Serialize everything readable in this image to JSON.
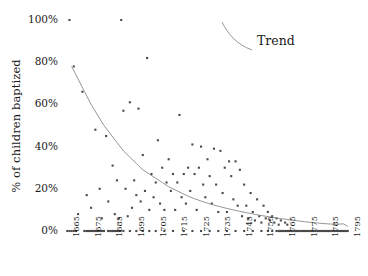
{
  "chart_data": {
    "type": "scatter",
    "title": "",
    "subtitle": "",
    "xlabel": "",
    "ylabel": "% of children baptized",
    "xlim": [
      1663,
      1797
    ],
    "ylim": [
      0,
      100
    ],
    "grid": false,
    "legend_position": "top-right",
    "legend": [
      {
        "name": "Trend",
        "style": "curve",
        "color": "#8a8a8a"
      }
    ],
    "annotations": [
      {
        "text": "Trend",
        "x": 1757,
        "y": 92
      }
    ],
    "y_ticks": [
      0,
      20,
      40,
      60,
      80,
      100
    ],
    "y_tick_labels": [
      "0%",
      "20%",
      "40%",
      "60%",
      "80%",
      "100%"
    ],
    "x_ticks": [
      1665,
      1675,
      1685,
      1695,
      1705,
      1715,
      1725,
      1735,
      1745,
      1755,
      1765,
      1775,
      1785,
      1795
    ],
    "x_tick_labels": [
      "1665",
      "1675",
      "1685",
      "1695",
      "1705",
      "1715",
      "1725",
      "1735",
      "1745",
      "1755",
      "1765",
      "1775",
      "1785",
      "1795"
    ],
    "marker": {
      "shape": "square",
      "size": 2.1,
      "color": "#4a4a4a"
    },
    "series": [
      {
        "name": "Parishes",
        "marker_color": "#4a4a4a",
        "points": [
          [
            1666,
            100
          ],
          [
            1690,
            100
          ],
          [
            1702,
            82
          ],
          [
            1668,
            78
          ],
          [
            1672,
            66
          ],
          [
            1694,
            61
          ],
          [
            1698,
            58
          ],
          [
            1691,
            57
          ],
          [
            1717,
            55
          ],
          [
            1678,
            48
          ],
          [
            1683,
            45
          ],
          [
            1707,
            43
          ],
          [
            1723,
            41
          ],
          [
            1727,
            40
          ],
          [
            1733,
            39
          ],
          [
            1736,
            38
          ],
          [
            1700,
            36
          ],
          [
            1712,
            34
          ],
          [
            1730,
            34
          ],
          [
            1740,
            33
          ],
          [
            1743,
            33
          ],
          [
            1686,
            31
          ],
          [
            1709,
            30
          ],
          [
            1721,
            30
          ],
          [
            1726,
            30
          ],
          [
            1738,
            30
          ],
          [
            1745,
            29
          ],
          [
            1704,
            27
          ],
          [
            1714,
            27
          ],
          [
            1719,
            27
          ],
          [
            1724,
            27
          ],
          [
            1731,
            26
          ],
          [
            1741,
            26
          ],
          [
            1688,
            24
          ],
          [
            1696,
            24
          ],
          [
            1706,
            23
          ],
          [
            1711,
            23
          ],
          [
            1716,
            23
          ],
          [
            1728,
            22
          ],
          [
            1734,
            22
          ],
          [
            1747,
            22
          ],
          [
            1680,
            20
          ],
          [
            1692,
            20
          ],
          [
            1701,
            19
          ],
          [
            1713,
            19
          ],
          [
            1722,
            19
          ],
          [
            1737,
            18
          ],
          [
            1750,
            18
          ],
          [
            1674,
            17
          ],
          [
            1697,
            17
          ],
          [
            1705,
            16
          ],
          [
            1718,
            16
          ],
          [
            1729,
            16
          ],
          [
            1742,
            15
          ],
          [
            1753,
            15
          ],
          [
            1684,
            14
          ],
          [
            1699,
            14
          ],
          [
            1708,
            13
          ],
          [
            1720,
            13
          ],
          [
            1732,
            13
          ],
          [
            1744,
            12
          ],
          [
            1748,
            12
          ],
          [
            1756,
            12
          ],
          [
            1676,
            11
          ],
          [
            1695,
            11
          ],
          [
            1703,
            10
          ],
          [
            1710,
            10
          ],
          [
            1715,
            10
          ],
          [
            1725,
            10
          ],
          [
            1735,
            9
          ],
          [
            1739,
            9
          ],
          [
            1751,
            9
          ],
          [
            1758,
            9
          ],
          [
            1670,
            8
          ],
          [
            1687,
            8
          ],
          [
            1693,
            7
          ],
          [
            1746,
            7
          ],
          [
            1754,
            7
          ],
          [
            1760,
            7
          ],
          [
            1681,
            6
          ],
          [
            1689,
            6
          ],
          [
            1749,
            6
          ],
          [
            1757,
            6
          ],
          [
            1762,
            6
          ],
          [
            1752,
            5
          ],
          [
            1759,
            5
          ],
          [
            1764,
            5
          ],
          [
            1755,
            4
          ],
          [
            1761,
            4
          ],
          [
            1766,
            4
          ],
          [
            1763,
            3
          ],
          [
            1767,
            3
          ],
          [
            1665,
            0
          ],
          [
            1666,
            0
          ],
          [
            1667,
            0
          ],
          [
            1668,
            0
          ],
          [
            1669,
            0
          ],
          [
            1673,
            0
          ],
          [
            1675,
            0
          ],
          [
            1676,
            0
          ],
          [
            1677,
            0
          ],
          [
            1678,
            0
          ],
          [
            1679,
            0
          ],
          [
            1680,
            0
          ],
          [
            1681,
            0
          ],
          [
            1682,
            0
          ],
          [
            1684,
            0
          ],
          [
            1685,
            0
          ],
          [
            1686,
            0
          ],
          [
            1687,
            0
          ],
          [
            1688,
            0
          ],
          [
            1689,
            0
          ],
          [
            1691,
            0
          ],
          [
            1694,
            0
          ],
          [
            1697,
            0
          ],
          [
            1700,
            0
          ],
          [
            1703,
            0
          ],
          [
            1706,
            0
          ],
          [
            1710,
            0
          ],
          [
            1714,
            0
          ],
          [
            1719,
            0
          ],
          [
            1723,
            0
          ],
          [
            1727,
            0
          ],
          [
            1731,
            0
          ],
          [
            1735,
            0
          ],
          [
            1739,
            0
          ],
          [
            1743,
            0
          ],
          [
            1747,
            0
          ],
          [
            1751,
            0
          ],
          [
            1755,
            0
          ],
          [
            1758,
            0
          ],
          [
            1760,
            0
          ],
          [
            1762,
            0
          ],
          [
            1763,
            0
          ],
          [
            1764,
            0
          ],
          [
            1765,
            0
          ],
          [
            1766,
            0
          ],
          [
            1767,
            0
          ],
          [
            1768,
            0
          ],
          [
            1769,
            0
          ],
          [
            1770,
            0
          ],
          [
            1771,
            0
          ],
          [
            1772,
            0
          ],
          [
            1773,
            0
          ],
          [
            1774,
            0
          ],
          [
            1775,
            0
          ],
          [
            1776,
            0
          ],
          [
            1777,
            0
          ],
          [
            1778,
            0
          ],
          [
            1779,
            0
          ],
          [
            1780,
            0
          ],
          [
            1781,
            0
          ],
          [
            1782,
            0
          ],
          [
            1783,
            0
          ],
          [
            1784,
            0
          ],
          [
            1785,
            0
          ],
          [
            1786,
            0
          ],
          [
            1787,
            0
          ],
          [
            1788,
            0
          ],
          [
            1789,
            0
          ],
          [
            1790,
            0
          ],
          [
            1791,
            0
          ],
          [
            1792,
            0
          ],
          [
            1793,
            0
          ],
          [
            1794,
            0
          ],
          [
            1795,
            0
          ]
        ]
      }
    ],
    "trend": {
      "name": "Trend",
      "color": "#8a8a8a",
      "points": [
        [
          1667,
          78
        ],
        [
          1670,
          72
        ],
        [
          1673,
          66
        ],
        [
          1676,
          60
        ],
        [
          1679,
          55
        ],
        [
          1682,
          50
        ],
        [
          1685,
          46
        ],
        [
          1688,
          42
        ],
        [
          1691,
          38
        ],
        [
          1694,
          35
        ],
        [
          1697,
          32
        ],
        [
          1700,
          29
        ],
        [
          1703,
          27
        ],
        [
          1706,
          25
        ],
        [
          1709,
          23
        ],
        [
          1712,
          21
        ],
        [
          1715,
          19.5
        ],
        [
          1718,
          18
        ],
        [
          1721,
          16.5
        ],
        [
          1724,
          15.3
        ],
        [
          1727,
          14.2
        ],
        [
          1730,
          13.2
        ],
        [
          1733,
          12.3
        ],
        [
          1736,
          11.5
        ],
        [
          1739,
          10.7
        ],
        [
          1742,
          10.0
        ],
        [
          1745,
          9.3
        ],
        [
          1748,
          8.7
        ],
        [
          1751,
          8.1
        ],
        [
          1754,
          7.5
        ],
        [
          1757,
          7.0
        ],
        [
          1760,
          6.5
        ],
        [
          1763,
          6.0
        ],
        [
          1766,
          5.6
        ],
        [
          1769,
          5.2
        ],
        [
          1772,
          4.8
        ],
        [
          1775,
          4.4
        ],
        [
          1778,
          4.1
        ],
        [
          1781,
          3.8
        ],
        [
          1784,
          3.5
        ],
        [
          1787,
          3.3
        ],
        [
          1790,
          3.2
        ],
        [
          1793,
          3.4
        ],
        [
          1795,
          2.2
        ]
      ]
    },
    "baseline_runs": [
      {
        "from": 1673,
        "to": 1682,
        "y": 0
      },
      {
        "from": 1684,
        "to": 1690,
        "y": 0
      },
      {
        "from": 1763,
        "to": 1795,
        "y": 0
      }
    ]
  },
  "legend_glyph": {
    "name": "trend-curve-glyph",
    "color": "#8a8a8a"
  }
}
